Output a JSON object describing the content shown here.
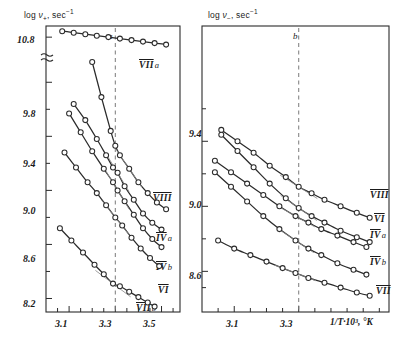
{
  "figure": {
    "panels": [
      {
        "id": "a",
        "letter": "a",
        "ylabel_parts": {
          "log": "log ",
          "nu": "ν",
          "subscript": "+",
          "units": ", sec",
          "exponent": "−1"
        },
        "ylabel_text": "log ν₊, sec⁻¹",
        "ytick_labels": [
          "10.8",
          "9.8",
          "9.4",
          "9.0",
          "8.6",
          "8.2"
        ],
        "ytick_values": [
          10.8,
          9.8,
          9.4,
          9.0,
          8.6,
          8.2
        ],
        "has_axis_break": true,
        "axis_break_symbol": "≈",
        "xtick_labels": [
          "3.1",
          "3.3",
          "3.5"
        ],
        "xtick_values": [
          3.1,
          3.3,
          3.5
        ],
        "xlim": [
          3.0,
          3.58
        ],
        "dashed_guide_x": 3.3,
        "curve_labels": [
          {
            "roman": "VII",
            "suffix": "a"
          },
          {
            "roman": "VIII",
            "suffix": ""
          },
          {
            "roman": "IV",
            "suffix": "a"
          },
          {
            "roman": "IV",
            "suffix": "b"
          },
          {
            "roman": "VI",
            "suffix": ""
          },
          {
            "roman": "VII",
            "suffix": "b"
          }
        ]
      },
      {
        "id": "b",
        "letter": "b",
        "ylabel_parts": {
          "log": "log ",
          "nu": "ν",
          "subscript": "−",
          "units": ", sec",
          "exponent": "−1"
        },
        "ylabel_text": "log ν₋, sec⁻¹",
        "ytick_labels": [
          "9.4",
          "9.0",
          "8.6"
        ],
        "ytick_values": [
          9.4,
          9.0,
          8.6
        ],
        "has_axis_break": false,
        "xtick_labels": [
          "3.1",
          "3.3"
        ],
        "xtick_values": [
          3.1,
          3.3
        ],
        "xlim": [
          3.0,
          3.58
        ],
        "dashed_guide_x": 3.3,
        "xlabel_text": "1/T·10³, °K",
        "curve_labels": [
          {
            "roman": "VIII",
            "suffix": ""
          },
          {
            "roman": "VI",
            "suffix": ""
          },
          {
            "roman": "IV",
            "suffix": "a"
          },
          {
            "roman": "IV",
            "suffix": "b"
          },
          {
            "roman": "VII",
            "suffix": ""
          }
        ]
      }
    ]
  },
  "chart_data": [
    {
      "type": "scatter",
      "panel": "a",
      "title": "a",
      "xlabel": "1/T·10³, °K",
      "ylabel": "log ν₊, sec⁻¹",
      "xlim": [
        3.0,
        3.58
      ],
      "ylim": [
        8.1,
        10.95
      ],
      "xticks": [
        3.1,
        3.3,
        3.5
      ],
      "yticks": [
        8.2,
        8.6,
        9.0,
        9.4,
        9.8,
        10.8
      ],
      "axis_break_between": [
        9.8,
        10.8
      ],
      "grid": false,
      "legend": "inline-right",
      "annotations": [
        {
          "text": "dashed vertical guide",
          "x": 3.3
        }
      ],
      "series": [
        {
          "name": "VII a",
          "marker": "open-circle",
          "x": [
            3.07,
            3.12,
            3.17,
            3.22,
            3.27,
            3.32,
            3.37,
            3.42,
            3.47,
            3.52
          ],
          "y": [
            10.88,
            10.86,
            10.84,
            10.82,
            10.8,
            10.78,
            10.76,
            10.74,
            10.72,
            10.7
          ]
        },
        {
          "name": "VIII",
          "marker": "open-circle",
          "x": [
            3.2,
            3.24,
            3.28,
            3.3,
            3.32,
            3.36,
            3.4,
            3.44,
            3.48,
            3.52
          ],
          "y": [
            9.95,
            9.69,
            9.44,
            9.33,
            9.26,
            9.16,
            9.06,
            8.98,
            8.91,
            8.86
          ]
        },
        {
          "name": "IV a",
          "marker": "open-circle",
          "x": [
            3.12,
            3.17,
            3.22,
            3.26,
            3.29,
            3.31,
            3.34,
            3.38,
            3.42,
            3.46,
            3.5
          ],
          "y": [
            9.64,
            9.52,
            9.38,
            9.26,
            9.17,
            9.13,
            9.03,
            8.93,
            8.83,
            8.76,
            8.71
          ]
        },
        {
          "name": "IV b",
          "marker": "open-circle",
          "x": [
            3.1,
            3.15,
            3.2,
            3.25,
            3.29,
            3.31,
            3.34,
            3.38,
            3.42,
            3.46,
            3.5
          ],
          "y": [
            9.57,
            9.43,
            9.29,
            9.16,
            9.06,
            9.0,
            8.92,
            8.82,
            8.72,
            8.64,
            8.58
          ]
        },
        {
          "name": "VI",
          "marker": "open-circle",
          "x": [
            3.08,
            3.13,
            3.18,
            3.22,
            3.26,
            3.3,
            3.33,
            3.37,
            3.41,
            3.45,
            3.49
          ],
          "y": [
            9.28,
            9.17,
            9.06,
            8.98,
            8.89,
            8.8,
            8.74,
            8.65,
            8.57,
            8.5,
            8.44
          ]
        },
        {
          "name": "VII b",
          "marker": "open-circle",
          "x": [
            3.06,
            3.11,
            3.16,
            3.21,
            3.25,
            3.29,
            3.32,
            3.36,
            3.4,
            3.44,
            3.47
          ],
          "y": [
            8.72,
            8.63,
            8.54,
            8.45,
            8.38,
            8.31,
            8.29,
            8.25,
            8.21,
            8.17,
            8.14
          ]
        }
      ]
    },
    {
      "type": "scatter",
      "panel": "b",
      "title": "b",
      "xlabel": "1/T·10³, °K",
      "ylabel": "log ν₋, sec⁻¹",
      "xlim": [
        3.0,
        3.58
      ],
      "ylim": [
        8.35,
        9.9
      ],
      "xticks": [
        3.1,
        3.3
      ],
      "yticks": [
        8.6,
        9.0,
        9.4
      ],
      "grid": false,
      "legend": "inline-right",
      "annotations": [
        {
          "text": "dashed vertical guide",
          "x": 3.3
        }
      ],
      "series": [
        {
          "name": "VIII",
          "marker": "open-circle",
          "x": [
            3.06,
            3.11,
            3.16,
            3.21,
            3.26,
            3.3,
            3.34,
            3.38,
            3.43,
            3.48,
            3.52
          ],
          "y": [
            9.47,
            9.4,
            9.33,
            9.25,
            9.18,
            9.12,
            9.08,
            9.04,
            9.0,
            8.96,
            8.93
          ]
        },
        {
          "name": "VI",
          "marker": "open-circle",
          "x": [
            3.06,
            3.11,
            3.16,
            3.21,
            3.26,
            3.3,
            3.34,
            3.38,
            3.43,
            3.48,
            3.52
          ],
          "y": [
            9.44,
            9.34,
            9.24,
            9.14,
            9.05,
            8.99,
            8.94,
            8.9,
            8.85,
            8.81,
            8.78
          ]
        },
        {
          "name": "IV a",
          "marker": "open-circle",
          "x": [
            3.04,
            3.09,
            3.14,
            3.19,
            3.24,
            3.29,
            3.33,
            3.37,
            3.42,
            3.47,
            3.51
          ],
          "y": [
            9.28,
            9.21,
            9.14,
            9.07,
            9.0,
            8.94,
            8.9,
            8.86,
            8.82,
            8.78,
            8.75
          ]
        },
        {
          "name": "IV b",
          "marker": "open-circle",
          "x": [
            3.04,
            3.09,
            3.14,
            3.19,
            3.24,
            3.29,
            3.33,
            3.37,
            3.42,
            3.47,
            3.51
          ],
          "y": [
            9.21,
            9.12,
            9.03,
            8.94,
            8.86,
            8.79,
            8.74,
            8.7,
            8.65,
            8.61,
            8.58
          ]
        },
        {
          "name": "VII",
          "marker": "open-circle",
          "x": [
            3.05,
            3.1,
            3.15,
            3.2,
            3.25,
            3.29,
            3.33,
            3.38,
            3.43,
            3.48,
            3.52
          ],
          "y": [
            8.79,
            8.74,
            8.7,
            8.66,
            8.62,
            8.59,
            8.56,
            8.53,
            8.5,
            8.47,
            8.45
          ]
        }
      ]
    }
  ]
}
